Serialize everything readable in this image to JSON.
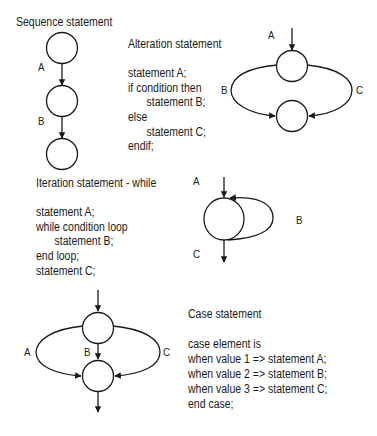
{
  "sequence": {
    "title": "Sequence statement",
    "labels": [
      "A",
      "B"
    ]
  },
  "alteration": {
    "title": "Alteration statement",
    "code": [
      "statement A;",
      "if condition then",
      "statement B;",
      "else",
      "statement C;",
      "endif;"
    ],
    "labels": {
      "top": "A",
      "left": "B",
      "right": "C"
    }
  },
  "iteration": {
    "title": "Iteration statement - while",
    "code": [
      "statement A;",
      "while condition loop",
      "statement B;",
      "end loop;",
      "statement C;"
    ],
    "labels": {
      "in": "A",
      "loop": "B",
      "out": "C"
    }
  },
  "case": {
    "title": "Case statement",
    "code": [
      "case element is",
      "when value 1 => statement A;",
      "when value 2 => statement B;",
      "when value 3 => statement C;",
      "end case;"
    ],
    "labels": {
      "left": "A",
      "middle": "B",
      "right": "C"
    }
  }
}
